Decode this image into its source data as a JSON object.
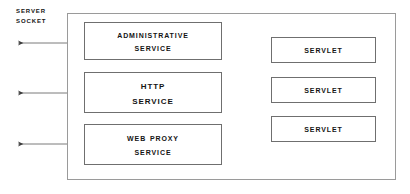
{
  "diagram": {
    "side_label": {
      "line1": "Server",
      "line2": "Socket"
    },
    "container": {
      "name": "server-container"
    },
    "services": [
      {
        "id": "administrative-service",
        "line1": "Administrative",
        "line2": "Service"
      },
      {
        "id": "http-service",
        "line1": "HTTP",
        "line2": "Service"
      },
      {
        "id": "web-proxy-service",
        "line1": "Web Proxy",
        "line2": "Service"
      }
    ],
    "servlets": [
      {
        "id": "servlet-1",
        "label": "Servlet"
      },
      {
        "id": "servlet-2",
        "label": "Servlet"
      },
      {
        "id": "servlet-3",
        "label": "Servlet"
      }
    ],
    "colors": {
      "box_border": "#6f6f6f",
      "container_border": "#9a9a9a",
      "connector": "#5a5a5a",
      "text": "#141414",
      "background": "#ffffff"
    },
    "connectors": [
      {
        "id": "socket-to-administrative-service",
        "direction": "left"
      },
      {
        "id": "socket-to-http-service",
        "direction": "left"
      },
      {
        "id": "socket-to-web-proxy-service",
        "direction": "left"
      },
      {
        "id": "http-service-to-servlet-1",
        "direction": "right"
      },
      {
        "id": "http-service-to-servlet-2",
        "direction": "right"
      },
      {
        "id": "http-service-to-servlet-3",
        "direction": "right"
      }
    ]
  }
}
